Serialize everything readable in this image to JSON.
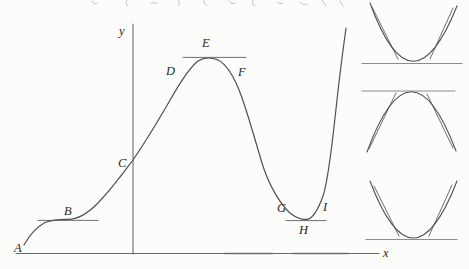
{
  "figure": {
    "background": "#fcfcfb",
    "colors": {
      "curve": "#4f4f4f",
      "axis": "#6a6a6a",
      "tangent": "#6e6e6e",
      "reference_line": "#8c8c8c",
      "label": "#262626",
      "artifact": "#b3b3b3"
    },
    "axis_labels": {
      "x": {
        "text": "x",
        "x": 383,
        "y": 257
      },
      "y": {
        "text": "y",
        "x": 119,
        "y": 35
      }
    },
    "point_labels": [
      {
        "text": "A",
        "x": 14,
        "y": 252
      },
      {
        "text": "B",
        "x": 64,
        "y": 215
      },
      {
        "text": "C",
        "x": 118,
        "y": 167
      },
      {
        "text": "D",
        "x": 166,
        "y": 75
      },
      {
        "text": "E",
        "x": 202,
        "y": 47
      },
      {
        "text": "F",
        "x": 238,
        "y": 76
      },
      {
        "text": "G",
        "x": 277,
        "y": 212
      },
      {
        "text": "H",
        "x": 299,
        "y": 234
      },
      {
        "text": "I",
        "x": 323,
        "y": 211
      }
    ]
  }
}
